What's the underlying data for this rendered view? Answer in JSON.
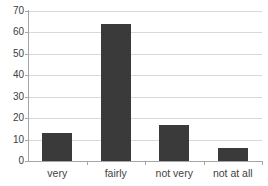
{
  "chart_data": {
    "type": "bar",
    "title": "",
    "subtitle": "",
    "xlabel": "",
    "ylabel": "",
    "categories": [
      "very",
      "fairly",
      "not very",
      "not at all"
    ],
    "values": [
      13,
      64,
      17,
      6
    ],
    "series": [
      {
        "name": "",
        "values": [
          13,
          64,
          17,
          6
        ]
      }
    ],
    "ylim": [
      0,
      70
    ],
    "yticks": [
      0,
      10,
      20,
      30,
      40,
      50,
      60,
      70
    ],
    "ytick_labels": [
      "0",
      "10",
      "20",
      "30",
      "40",
      "50",
      "60",
      "70"
    ],
    "grid": true,
    "grid_axis": "y",
    "legend": false,
    "legend_position": "none",
    "annotations": [],
    "colors": {
      "bar": "#3a3a3a",
      "gridline": "#d9d9d9",
      "axis": "#a6a6a6",
      "tick_text": "#404040",
      "category_text": "#3f3f3f",
      "background": "#ffffff"
    }
  }
}
